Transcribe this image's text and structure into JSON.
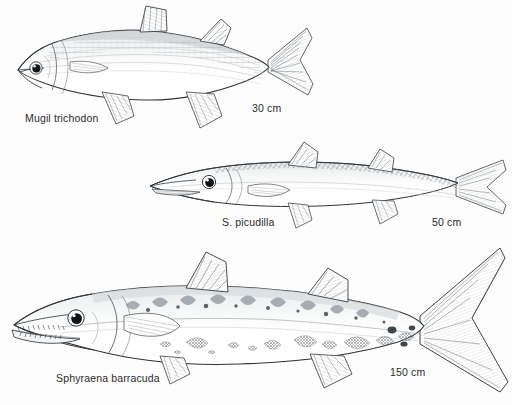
{
  "plate": {
    "kind": "scientific-fish-illustration-plate",
    "background_color": "#fdfdfd",
    "ink_color": "#2b2b2b",
    "fill_color": "#ffffff",
    "shade_color": "#9aa0a6"
  },
  "figures": [
    {
      "id": "mugil-trichodon",
      "species_label": "Mugil trichodon",
      "common_form": "mullet",
      "size_label": "30 cm",
      "position": "top",
      "label_xy": [
        25,
        113
      ],
      "size_label_xy": [
        252,
        103
      ]
    },
    {
      "id": "sphyraena-picudilla",
      "species_label": "S. picudilla",
      "common_form": "sennet",
      "size_label": "50 cm",
      "position": "middle",
      "label_xy": [
        222,
        217
      ],
      "size_label_xy": [
        432,
        217
      ]
    },
    {
      "id": "sphyraena-barracuda",
      "species_label": "Sphyraena barracuda",
      "common_form": "great barracuda",
      "size_label": "150 cm",
      "position": "bottom",
      "label_xy": [
        56,
        373
      ],
      "size_label_xy": [
        390,
        367
      ]
    }
  ]
}
